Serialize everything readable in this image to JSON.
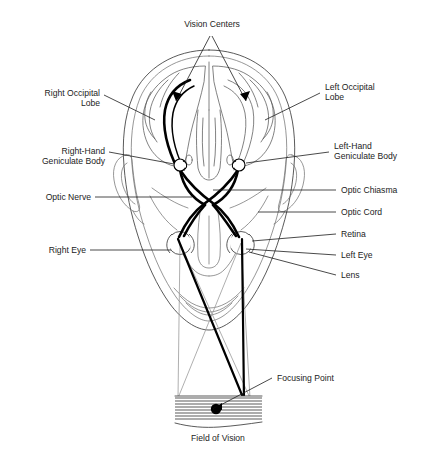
{
  "figure": {
    "type": "anatomical-diagram",
    "caption": "Field of Vision"
  },
  "labels": {
    "vision_centers": "Vision Centers",
    "right_occipital_lobe_line1": "Right Occipital",
    "right_occipital_lobe_line2": "Lobe",
    "left_occipital_lobe_line1": "Left Occipital",
    "left_occipital_lobe_line2": "Lobe",
    "right_hand_geniculate_line1": "Right-Hand",
    "right_hand_geniculate_line2": "Geniculate Body",
    "left_hand_geniculate_line1": "Left-Hand",
    "left_hand_geniculate_line2": "Geniculate Body",
    "optic_nerve": "Optic Nerve",
    "optic_chiasma": "Optic Chiasma",
    "optic_cord": "Optic Cord",
    "retina": "Retina",
    "right_eye": "Right Eye",
    "left_eye": "Left Eye",
    "lens": "Lens",
    "focusing_point": "Focusing Point",
    "field_of_vision": "Field of Vision"
  },
  "colors": {
    "ink": "#1c1c1c",
    "outline": "#3c3c3c",
    "brain": "#585858",
    "tract": "#000000",
    "cone": "#9a9a9a",
    "background": "#ffffff"
  },
  "parts": [
    {
      "name": "vision-centers",
      "label": "Vision Centers",
      "side": "both"
    },
    {
      "name": "right-occipital-lobe",
      "label": "Right Occipital Lobe",
      "side": "right"
    },
    {
      "name": "left-occipital-lobe",
      "label": "Left Occipital Lobe",
      "side": "left"
    },
    {
      "name": "right-hand-geniculate-body",
      "label": "Right-Hand Geniculate Body",
      "side": "right"
    },
    {
      "name": "left-hand-geniculate-body",
      "label": "Left-Hand Geniculate Body",
      "side": "left"
    },
    {
      "name": "optic-nerve",
      "label": "Optic Nerve",
      "side": "right"
    },
    {
      "name": "optic-chiasma",
      "label": "Optic Chiasma",
      "side": "center"
    },
    {
      "name": "optic-cord",
      "label": "Optic Cord",
      "side": "left"
    },
    {
      "name": "retina",
      "label": "Retina",
      "side": "left"
    },
    {
      "name": "right-eye",
      "label": "Right Eye",
      "side": "right"
    },
    {
      "name": "left-eye",
      "label": "Left Eye",
      "side": "left"
    },
    {
      "name": "lens",
      "label": "Lens",
      "side": "left"
    },
    {
      "name": "focusing-point",
      "label": "Focusing Point",
      "side": "center"
    },
    {
      "name": "field-of-vision",
      "label": "Field of Vision",
      "side": "center"
    }
  ]
}
